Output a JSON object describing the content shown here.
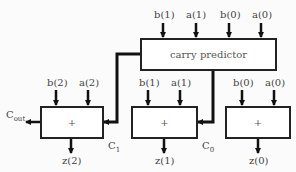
{
  "diagram": {
    "predictor": {
      "label": "carry predictor",
      "inputs": [
        "b(1)",
        "a(1)",
        "b(0)",
        "a(0)"
      ]
    },
    "adders": [
      {
        "op": "+",
        "inputs": [
          "b(2)",
          "a(2)"
        ],
        "output": "z(2)"
      },
      {
        "op": "+",
        "inputs": [
          "b(1)",
          "a(1)"
        ],
        "output": "z(1)"
      },
      {
        "op": "+",
        "inputs": [
          "b(0)",
          "a(0)"
        ],
        "output": "z(0)"
      }
    ],
    "signals": {
      "cout_main": "C",
      "cout_sub": "out",
      "c1_main": "C",
      "c1_sub": "1",
      "c0_main": "C",
      "c0_sub": "0"
    }
  }
}
